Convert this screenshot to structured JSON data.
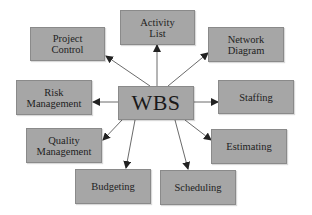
{
  "diagram": {
    "center": {
      "label": "WBS"
    },
    "nodes": [
      {
        "id": "activity-list",
        "label": "Activity\nList"
      },
      {
        "id": "project-control",
        "label": "Project\nControl"
      },
      {
        "id": "network-diagram",
        "label": "Network\nDiagram"
      },
      {
        "id": "risk-management",
        "label": "Risk\nManagement"
      },
      {
        "id": "staffing",
        "label": "Staffing"
      },
      {
        "id": "quality-management",
        "label": "Quality\nManagement"
      },
      {
        "id": "estimating",
        "label": "Estimating"
      },
      {
        "id": "budgeting",
        "label": "Budgeting"
      },
      {
        "id": "scheduling",
        "label": "Scheduling"
      }
    ],
    "edges": [
      {
        "from": "WBS",
        "to": "Activity List"
      },
      {
        "from": "WBS",
        "to": "Project Control"
      },
      {
        "from": "WBS",
        "to": "Network Diagram"
      },
      {
        "from": "WBS",
        "to": "Risk Management"
      },
      {
        "from": "WBS",
        "to": "Staffing"
      },
      {
        "from": "WBS",
        "to": "Quality Management"
      },
      {
        "from": "WBS",
        "to": "Estimating"
      },
      {
        "from": "WBS",
        "to": "Budgeting"
      },
      {
        "from": "WBS",
        "to": "Scheduling"
      }
    ],
    "colors": {
      "box_fill": "#a6a6a6",
      "box_border": "#8a8a8a",
      "arrow": "#333333",
      "text": "#222222"
    }
  }
}
